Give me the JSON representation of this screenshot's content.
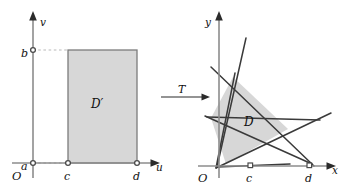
{
  "figure": {
    "background_color": "#ffffff",
    "region_fill_color": "#d7d7d7",
    "line_color": "#3a3a3a",
    "axis_color": "#8c8c8c"
  },
  "left_panel": {
    "name": "uv-plane",
    "axes": {
      "horizontal_label": "u",
      "vertical_label": "v",
      "origin_label": "O"
    },
    "ticks": {
      "u_axis": [
        "c",
        "d"
      ],
      "v_axis": [
        "a",
        "b"
      ]
    },
    "region": {
      "label": "D′",
      "shape": "rectangle",
      "description": "rectangle with u from c to d and v from a to b",
      "u_min": "c",
      "u_max": "d",
      "v_min": "a",
      "v_max": "b"
    },
    "guides": [
      "dashed horizontal from b to rectangle top-left corner",
      "dashed horizontal from a to rectangle bottom-left corner"
    ]
  },
  "map_arrow": {
    "label": "T",
    "direction": "left-to-right",
    "name": "transformation-arrow"
  },
  "right_panel": {
    "name": "xy-plane",
    "axes": {
      "horizontal_label": "x",
      "vertical_label": "y",
      "origin_label": "O"
    },
    "ticks": {
      "x_axis": [
        "c",
        "d"
      ]
    },
    "region": {
      "label": "D",
      "shape": "quadrilateral",
      "description": "curvilinear quadrilateral image of D′ under T bounded by four straight lines"
    },
    "lines": [
      {
        "name": "image-of-u-equals-c",
        "through": "origin",
        "slope": "steep-positive"
      },
      {
        "name": "image-of-u-equals-d",
        "through": "origin",
        "slope": "very-steep-positive"
      },
      {
        "name": "image-of-v-equals-b",
        "slope": "negative",
        "note": "upper boundary line descending to the right toward d"
      },
      {
        "name": "image-of-v-equals-a",
        "slope": "negative",
        "note": "lower boundary line descending to the right"
      }
    ]
  }
}
